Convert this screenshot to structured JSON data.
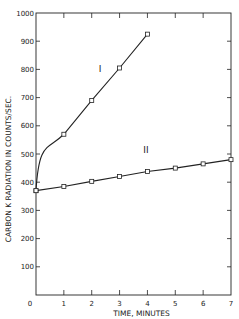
{
  "chart_data": {
    "type": "line",
    "title": "",
    "xlabel": "TIME, MINUTES",
    "ylabel": "CARBON K RADIATION IN COUNTS/SEC.",
    "xlim": [
      0,
      7
    ],
    "ylim": [
      0,
      1000
    ],
    "x_ticks": [
      0,
      1,
      2,
      3,
      4,
      5,
      6,
      7
    ],
    "y_ticks": [
      100,
      200,
      300,
      400,
      500,
      600,
      700,
      800,
      900,
      1000
    ],
    "x_tick_labels": [
      "0",
      "1",
      "2",
      "3",
      "4",
      "5",
      "6",
      "7"
    ],
    "y_tick_labels": [
      "100",
      "200",
      "300",
      "400",
      "500",
      "600",
      "700",
      "800",
      "900",
      "1000"
    ],
    "grid": false,
    "legend": "none (series labeled inline)",
    "series": [
      {
        "name": "I",
        "marker": "open-square",
        "x": [
          0,
          1,
          2,
          3,
          4
        ],
        "values": [
          370,
          570,
          690,
          805,
          925
        ]
      },
      {
        "name": "II",
        "marker": "open-square",
        "x": [
          0,
          1,
          2,
          3,
          4,
          5,
          6,
          7
        ],
        "values": [
          370,
          385,
          403,
          420,
          438,
          450,
          465,
          480
        ]
      }
    ],
    "annotations": [
      {
        "text": "I",
        "near": {
          "x": 2.2,
          "y": 770
        }
      },
      {
        "text": "II",
        "near": {
          "x": 3.8,
          "y": 505
        }
      }
    ]
  },
  "labels": {
    "xlabel": "TIME, MINUTES",
    "ylabel": "CARBON K RADIATION IN COUNTS/SEC.",
    "series_I": "I",
    "series_II": "II",
    "origin": "0"
  },
  "colors": {
    "ink": "#222222",
    "background": "#ffffff"
  }
}
